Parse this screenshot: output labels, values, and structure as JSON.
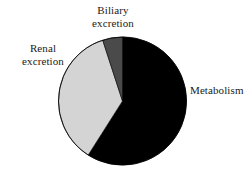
{
  "figure": {
    "background_color": "#ffffff",
    "type": "pie-chart-figure"
  },
  "chart_data": {
    "type": "pie",
    "title": "",
    "xlabel": "",
    "ylabel": "",
    "legend_position": "none",
    "grid": false,
    "labels_placement": "outside-callout",
    "start_angle_deg": 0,
    "direction": "clockwise",
    "categories": [
      "Metabolism",
      "Renal excretion",
      "Biliary excretion"
    ],
    "values": [
      59,
      36,
      5
    ],
    "units": "percent",
    "colors": [
      "#000000",
      "#d4d4d4",
      "#4a4a4a"
    ],
    "slices": [
      {
        "label": "Metabolism",
        "value": 59,
        "color": "#000000",
        "start_angle_deg": 0,
        "end_angle_deg": 212.4
      },
      {
        "label": "Renal excretion",
        "value": 36,
        "color": "#d4d4d4",
        "start_angle_deg": 212.4,
        "end_angle_deg": 342.0
      },
      {
        "label": "Biliary excretion",
        "value": 5,
        "color": "#4a4a4a",
        "start_angle_deg": 342.0,
        "end_angle_deg": 360.0
      }
    ],
    "geometry": {
      "center_x": 122.5,
      "center_y": 101,
      "radius": 64,
      "outline_color": "#000000"
    }
  },
  "labels": {
    "biliary": "Biliary\nexcretion",
    "renal": "Renal\nexcretion",
    "metabolism": "Metabolism"
  }
}
